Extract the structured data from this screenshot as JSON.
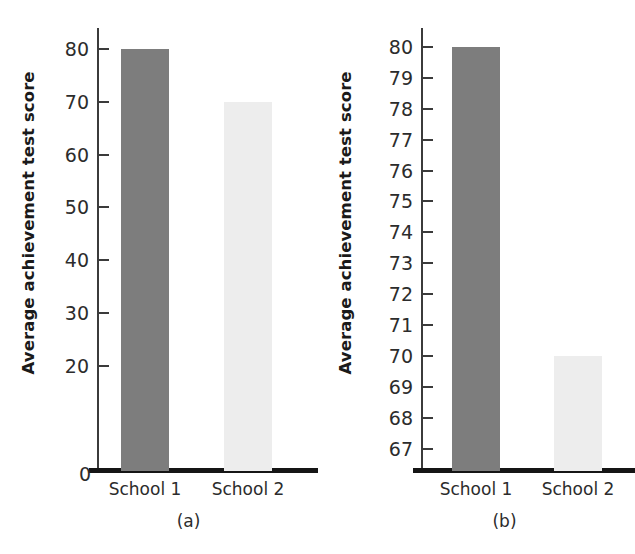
{
  "chart_data": [
    {
      "type": "bar",
      "title": "",
      "panel_label": "(a)",
      "xlabel": "",
      "ylabel": "Average achievement test score",
      "categories": [
        "School 1",
        "School 2"
      ],
      "values": [
        80,
        70
      ],
      "ylim": [
        0,
        84
      ],
      "yticks": [
        20,
        30,
        40,
        50,
        60,
        70,
        80
      ],
      "zero_label": "0",
      "grid": false,
      "legend": "none",
      "bar_colors": [
        "#7d7d7d",
        "#ededed"
      ]
    },
    {
      "type": "bar",
      "title": "",
      "panel_label": "(b)",
      "xlabel": "",
      "ylabel": "Average achievement test score",
      "categories": [
        "School 1",
        "School 2"
      ],
      "values": [
        80,
        70
      ],
      "ylim": [
        66.3,
        80.6
      ],
      "yticks": [
        67,
        68,
        69,
        70,
        71,
        72,
        73,
        74,
        75,
        76,
        77,
        78,
        79,
        80
      ],
      "zero_label": "",
      "grid": false,
      "legend": "none",
      "bar_colors": [
        "#7d7d7d",
        "#ededed"
      ]
    }
  ]
}
